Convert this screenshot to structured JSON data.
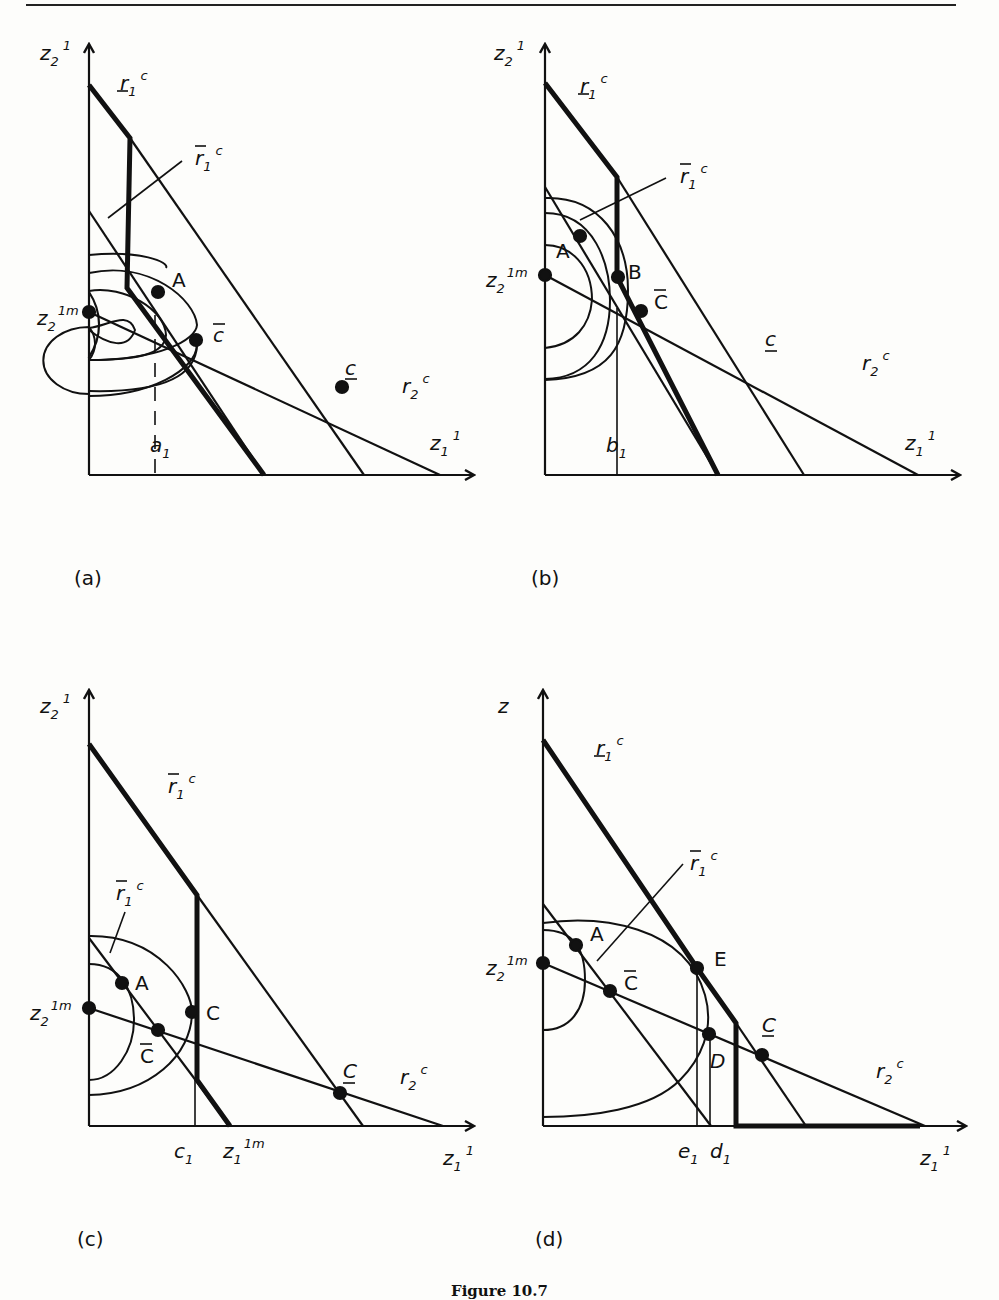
{
  "caption": "Figure 10.7",
  "panels": [
    {
      "id": "a",
      "label": "(a)",
      "y_axis": {
        "base": "z",
        "sub": "2",
        "sup": "1"
      },
      "x_axis": {
        "base": "z",
        "sub": "1",
        "sup": "1"
      },
      "intercept_label": {
        "base": "z",
        "sub": "2",
        "sup": "1m"
      },
      "tick_label": {
        "base": "a",
        "sub": "1"
      },
      "lines": {
        "r1c_under": {
          "base": "r",
          "sub": "1",
          "sup": "c",
          "mark": "underbar"
        },
        "r1c_over": {
          "base": "r",
          "sub": "1",
          "sup": "c",
          "mark": "overbar"
        },
        "r2c": {
          "base": "r",
          "sub": "2",
          "sup": "c"
        }
      },
      "points": [
        {
          "name": "A",
          "label": "A"
        },
        {
          "name": "C-bar",
          "label": "c",
          "mark": "overbar"
        },
        {
          "name": "C-under",
          "label": "c",
          "mark": "underbar"
        }
      ]
    },
    {
      "id": "b",
      "label": "(b)",
      "y_axis": {
        "base": "z",
        "sub": "2",
        "sup": "1"
      },
      "x_axis": {
        "base": "z",
        "sub": "1",
        "sup": "1"
      },
      "intercept_label": {
        "base": "z",
        "sub": "2",
        "sup": "1m"
      },
      "tick_label": {
        "base": "b",
        "sub": "1"
      },
      "lines": {
        "r1c_under": {
          "base": "r",
          "sub": "1",
          "sup": "c",
          "mark": "underbar"
        },
        "r1c_over": {
          "base": "r",
          "sub": "1",
          "sup": "c",
          "mark": "overbar"
        },
        "r2c": {
          "base": "r",
          "sub": "2",
          "sup": "c"
        }
      },
      "points": [
        {
          "name": "A",
          "label": "A"
        },
        {
          "name": "B",
          "label": "B"
        },
        {
          "name": "C-bar",
          "label": "C",
          "mark": "overbar"
        },
        {
          "name": "C-under",
          "label": "c",
          "mark": "underbar"
        }
      ]
    },
    {
      "id": "c",
      "label": "(c)",
      "y_axis": {
        "base": "z",
        "sub": "2",
        "sup": "1"
      },
      "x_axis": {
        "base": "z",
        "sub": "1",
        "sup": "1"
      },
      "intercept_label": {
        "base": "z",
        "sub": "2",
        "sup": "1m"
      },
      "tick_label": {
        "base": "c",
        "sub": "1"
      },
      "tick_label_2": {
        "base": "z",
        "sub": "1",
        "sup": "1m"
      },
      "lines": {
        "r1c_top": {
          "base": "r",
          "sub": "1",
          "sup": "c",
          "mark": "overbar"
        },
        "r1c_over": {
          "base": "r",
          "sub": "1",
          "sup": "c",
          "mark": "overbar"
        },
        "r2c": {
          "base": "r",
          "sub": "2",
          "sup": "c"
        }
      },
      "points": [
        {
          "name": "A",
          "label": "A"
        },
        {
          "name": "C",
          "label": "C"
        },
        {
          "name": "C-bar",
          "label": "C",
          "mark": "overbar"
        },
        {
          "name": "C-under",
          "label": "C",
          "mark": "underbar"
        }
      ]
    },
    {
      "id": "d",
      "label": "(d)",
      "y_axis": {
        "base": "z",
        "sub": "",
        "sup": ""
      },
      "x_axis": {
        "base": "z",
        "sub": "1",
        "sup": "1"
      },
      "intercept_label": {
        "base": "z",
        "sub": "2",
        "sup": "1m"
      },
      "tick_label": {
        "base": "e",
        "sub": "1"
      },
      "tick_label_2": {
        "base": "d",
        "sub": "1"
      },
      "lines": {
        "r1c_under": {
          "base": "r",
          "sub": "1",
          "sup": "c",
          "mark": "underbar"
        },
        "r1c_over": {
          "base": "r",
          "sub": "1",
          "sup": "c",
          "mark": "overbar"
        },
        "r2c": {
          "base": "r",
          "sub": "2",
          "sup": "c"
        }
      },
      "points": [
        {
          "name": "A",
          "label": "A"
        },
        {
          "name": "E",
          "label": "E"
        },
        {
          "name": "C-bar",
          "label": "C",
          "mark": "overbar"
        },
        {
          "name": "D",
          "label": "D"
        },
        {
          "name": "C-under",
          "label": "C",
          "mark": "underbar"
        }
      ]
    }
  ]
}
